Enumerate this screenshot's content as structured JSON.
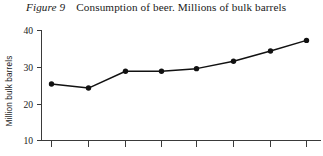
{
  "caption": {
    "figure_number": "Figure 9",
    "title": "Consumption of beer. Millions of bulk barrels"
  },
  "chart_data": {
    "type": "line",
    "title": "Consumption of beer. Millions of bulk barrels",
    "xlabel": "",
    "ylabel": "Million bulk barrels",
    "x": [
      1,
      2,
      3,
      4,
      5,
      6,
      7,
      8
    ],
    "values": [
      25.4,
      24.3,
      28.9,
      28.9,
      29.6,
      31.6,
      34.4,
      37.3
    ],
    "ylim": [
      10,
      40
    ],
    "ytick_labels": [
      "10",
      "20",
      "30",
      "40"
    ],
    "ytick_values": [
      10,
      20,
      30,
      40
    ],
    "xtick_labels": [
      "",
      "",
      "",
      "",
      "",
      "",
      "",
      ""
    ],
    "grid": false,
    "legend": false,
    "marker": "filled-circle",
    "line_color": "#111111",
    "marker_color": "#111111",
    "axis_color": "#3a3a3a",
    "background": "#ffffff"
  }
}
